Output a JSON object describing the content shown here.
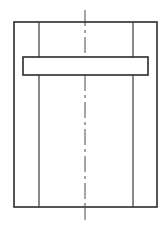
{
  "drawing": {
    "title": "Piston sleeve cross-section line drawing",
    "canvas": {
      "width": 167,
      "height": 227,
      "background": "#ffffff"
    },
    "style": {
      "line_color": "#2b2b2b",
      "line_color_light": "#4a4a4a",
      "fill_color": "#ffffff",
      "outer_stroke_width": 1.6,
      "inner_stroke_width": 1.3,
      "ring_stroke_width": 1.6,
      "centerline_stroke_width": 1.0,
      "centerline_dash": "16 4 3 4"
    },
    "parts": [
      {
        "name": "outer-body",
        "label": "Outer body outline",
        "shape": "rectangle",
        "x": 14,
        "y": 22,
        "width": 143,
        "height": 185
      },
      {
        "name": "left-wall-line",
        "label": "Left inner wall line",
        "shape": "vertical-line",
        "x": 39,
        "y1": 22,
        "y2": 207
      },
      {
        "name": "right-wall-line",
        "label": "Right inner wall line",
        "shape": "vertical-line",
        "x": 133,
        "y1": 22,
        "y2": 207
      },
      {
        "name": "ring-band",
        "label": "Ring band / collar",
        "shape": "rectangle",
        "x": 23,
        "y": 57,
        "width": 125,
        "height": 18
      },
      {
        "name": "axis-centerline",
        "label": "Vertical axis centerline",
        "shape": "dash-dot-line",
        "x": 85,
        "y1": 10,
        "y2": 220
      }
    ]
  },
  "chart_data": {
    "type": "diagram",
    "subtitle": "",
    "units": "px",
    "view": "front cross-section",
    "annotations": [],
    "geometry": {
      "outer_rect": {
        "x1": 14,
        "y1": 22,
        "x2": 157,
        "y2": 207,
        "width": 143,
        "height": 185
      },
      "inner_wall_lines_x": [
        39,
        133
      ],
      "ring_band_rect": {
        "x1": 23,
        "y1": 57,
        "x2": 148,
        "y2": 75,
        "width": 125,
        "height": 18
      },
      "centerline": {
        "x": 85,
        "y1": 10,
        "y2": 220
      }
    },
    "xlim": [
      0,
      167
    ],
    "ylim": [
      0,
      227
    ],
    "grid": false,
    "legend": null
  }
}
